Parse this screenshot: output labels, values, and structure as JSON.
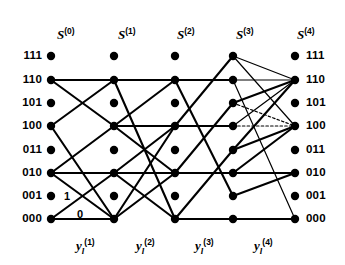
{
  "figure": {
    "type": "trellis-diagram",
    "width": 345,
    "height": 265,
    "background": "#ffffff",
    "ink_color": "#000000"
  },
  "columns": {
    "headers": [
      {
        "symbol": "S",
        "superscript": "(0)",
        "x": 57,
        "y": 28
      },
      {
        "symbol": "S",
        "superscript": "(1)",
        "x": 118,
        "y": 28
      },
      {
        "symbol": "S",
        "superscript": "(2)",
        "x": 177,
        "y": 28
      },
      {
        "symbol": "S",
        "superscript": "(3)",
        "x": 236,
        "y": 28
      },
      {
        "symbol": "S",
        "superscript": "(4)",
        "x": 297,
        "y": 28
      }
    ],
    "x_positions": [
      51,
      114,
      175,
      233,
      295
    ]
  },
  "states": {
    "labels": [
      "111",
      "110",
      "101",
      "100",
      "011",
      "010",
      "001",
      "000"
    ],
    "y_positions": [
      56,
      80,
      103,
      126,
      150,
      173,
      196,
      219
    ],
    "left_label_x": 16,
    "right_label_x": 306
  },
  "outputs": {
    "headers": [
      {
        "symbol": "y",
        "subscript": "l",
        "superscript": "(1)",
        "x": 76,
        "y": 239
      },
      {
        "symbol": "y",
        "subscript": "l",
        "superscript": "(2)",
        "x": 136,
        "y": 239
      },
      {
        "symbol": "y",
        "subscript": "l",
        "superscript": "(3)",
        "x": 195,
        "y": 239
      },
      {
        "symbol": "y",
        "subscript": "l",
        "superscript": "(4)",
        "x": 254,
        "y": 239
      }
    ]
  },
  "edge_bit_labels": [
    {
      "text": "1",
      "x": 64,
      "y": 191
    },
    {
      "text": "0",
      "x": 77,
      "y": 209
    }
  ],
  "chart_data": {
    "type": "diagram",
    "title": "",
    "node_radius": 4.2,
    "edges": [
      {
        "stage": 0,
        "from": "110",
        "to": "110",
        "weight": "thick"
      },
      {
        "stage": 0,
        "from": "110",
        "to": "100",
        "weight": "thick"
      },
      {
        "stage": 0,
        "from": "100",
        "to": "110",
        "weight": "thick"
      },
      {
        "stage": 0,
        "from": "100",
        "to": "000",
        "weight": "thick"
      },
      {
        "stage": 0,
        "from": "010",
        "to": "010",
        "weight": "thick"
      },
      {
        "stage": 0,
        "from": "010",
        "to": "100",
        "weight": "thick"
      },
      {
        "stage": 0,
        "from": "010",
        "to": "000",
        "weight": "thick"
      },
      {
        "stage": 0,
        "from": "000",
        "to": "010",
        "weight": "thick"
      },
      {
        "stage": 0,
        "from": "000",
        "to": "000",
        "weight": "thick"
      },
      {
        "stage": 1,
        "from": "110",
        "to": "110",
        "weight": "thick"
      },
      {
        "stage": 1,
        "from": "110",
        "to": "000",
        "weight": "thick"
      },
      {
        "stage": 1,
        "from": "100",
        "to": "110",
        "weight": "thick"
      },
      {
        "stage": 1,
        "from": "100",
        "to": "100",
        "weight": "thick"
      },
      {
        "stage": 1,
        "from": "100",
        "to": "010",
        "weight": "thick"
      },
      {
        "stage": 1,
        "from": "010",
        "to": "100",
        "weight": "thick"
      },
      {
        "stage": 1,
        "from": "010",
        "to": "010",
        "weight": "thick"
      },
      {
        "stage": 1,
        "from": "010",
        "to": "000",
        "weight": "thick"
      },
      {
        "stage": 1,
        "from": "000",
        "to": "100",
        "weight": "thick"
      },
      {
        "stage": 1,
        "from": "000",
        "to": "010",
        "weight": "thick"
      },
      {
        "stage": 2,
        "from": "110",
        "to": "110",
        "weight": "thick"
      },
      {
        "stage": 2,
        "from": "110",
        "to": "001",
        "weight": "thick"
      },
      {
        "stage": 2,
        "from": "100",
        "to": "111",
        "weight": "thick"
      },
      {
        "stage": 2,
        "from": "100",
        "to": "100",
        "weight": "thick"
      },
      {
        "stage": 2,
        "from": "010",
        "to": "101",
        "weight": "thick"
      },
      {
        "stage": 2,
        "from": "010",
        "to": "010",
        "weight": "thick"
      },
      {
        "stage": 2,
        "from": "000",
        "to": "011",
        "weight": "thick"
      },
      {
        "stage": 2,
        "from": "000",
        "to": "000",
        "weight": "thick"
      },
      {
        "stage": 3,
        "from": "111",
        "to": "110",
        "weight": "thin"
      },
      {
        "stage": 3,
        "from": "111",
        "to": "100",
        "weight": "thin"
      },
      {
        "stage": 3,
        "from": "110",
        "to": "110",
        "weight": "thin"
      },
      {
        "stage": 3,
        "from": "110",
        "to": "000",
        "weight": "thin"
      },
      {
        "stage": 3,
        "from": "101",
        "to": "110",
        "weight": "thick"
      },
      {
        "stage": 3,
        "from": "101",
        "to": "100",
        "weight": "dotted"
      },
      {
        "stage": 3,
        "from": "100",
        "to": "110",
        "weight": "thin"
      },
      {
        "stage": 3,
        "from": "100",
        "to": "100",
        "weight": "dotted"
      },
      {
        "stage": 3,
        "from": "011",
        "to": "110",
        "weight": "thick"
      },
      {
        "stage": 3,
        "from": "011",
        "to": "100",
        "weight": "thick"
      },
      {
        "stage": 3,
        "from": "010",
        "to": "010",
        "weight": "thick"
      },
      {
        "stage": 3,
        "from": "010",
        "to": "100",
        "weight": "thick"
      },
      {
        "stage": 3,
        "from": "001",
        "to": "010",
        "weight": "thick"
      },
      {
        "stage": 3,
        "from": "000",
        "to": "000",
        "weight": "thick"
      }
    ]
  }
}
